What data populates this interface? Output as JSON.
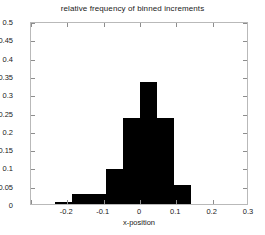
{
  "chart_data": {
    "type": "bar",
    "title": "relative frequency of binned increments",
    "xlabel": "x-position",
    "ylabel": "",
    "xlim": [
      -0.3,
      0.3
    ],
    "ylim": [
      0,
      0.5
    ],
    "grid": false,
    "legend": null,
    "bar_color": "#000000",
    "axis_color": "#b9b9b9",
    "background_color": "#ffffff",
    "xticks": [
      -0.3,
      -0.2,
      -0.1,
      0,
      0.1,
      0.2,
      0.3
    ],
    "xticklabels": [
      "",
      "-0.2",
      "-0.1",
      "0",
      "0.1",
      "0.2",
      "0.3"
    ],
    "yticks": [
      0,
      0.05,
      0.1,
      0.15,
      0.2,
      0.25,
      0.3,
      0.35,
      0.4,
      0.45,
      0.5
    ],
    "yticklabels": [
      "0",
      "0.05",
      "0.1",
      "0.15",
      "0.2",
      "0.25",
      "0.3",
      "0.35",
      "0.4",
      "0.45",
      "0.5"
    ],
    "bin_width": 0.047,
    "bin_edges": [
      -0.235,
      -0.188,
      -0.141,
      -0.094,
      -0.047,
      0.0,
      0.047,
      0.094,
      0.141
    ],
    "categories": [
      "-0.212",
      "-0.165",
      "-0.118",
      "-0.071",
      "-0.024",
      "0.024",
      "0.071",
      "0.118"
    ],
    "values": [
      0.005,
      0.028,
      0.028,
      0.097,
      0.235,
      0.333,
      0.235,
      0.053
    ]
  },
  "axis": {
    "title": "relative frequency of binned increments",
    "xaxis_title": "x-position"
  }
}
